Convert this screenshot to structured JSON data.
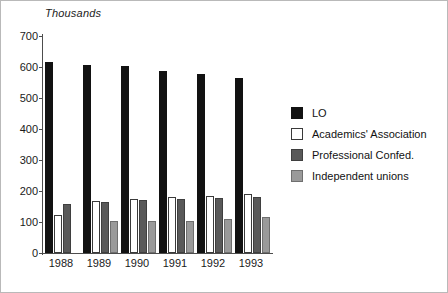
{
  "chart_data": {
    "type": "bar",
    "title": "",
    "subtitle": "",
    "unit_title": "Thousands",
    "xlabel": "",
    "ylabel": "Thousands",
    "ylim": [
      0,
      700
    ],
    "ytick_step": 100,
    "yticks": [
      700,
      600,
      500,
      400,
      300,
      200,
      100,
      0
    ],
    "ytick_labels": [
      "700",
      "600",
      "500",
      "400",
      "300",
      "200",
      "100",
      "0"
    ],
    "categories": [
      "1988",
      "1989",
      "1990",
      "1991",
      "1992",
      "1993"
    ],
    "grid": false,
    "legend_position": "right",
    "series": [
      {
        "name": "LO",
        "color": "#121212",
        "values": [
          617,
          608,
          604,
          588,
          577,
          566
        ]
      },
      {
        "name": "Academics' Association",
        "color": "#ffffff",
        "values": [
          124,
          168,
          174,
          181,
          184,
          189
        ]
      },
      {
        "name": "Professional Confed.",
        "color": "#595959",
        "values": [
          159,
          164,
          170,
          173,
          177,
          180
        ]
      },
      {
        "name": "Independent unions",
        "color": "#9a9a9a",
        "values": [
          null,
          102,
          103,
          104,
          110,
          117
        ]
      }
    ]
  },
  "legend": {
    "items": [
      {
        "label": "LO",
        "swatch": "lo"
      },
      {
        "label": "Academics' Association",
        "swatch": "aa"
      },
      {
        "label": "Professional Confed.",
        "swatch": "pc"
      },
      {
        "label": "Independent unions",
        "swatch": "iu"
      }
    ]
  }
}
